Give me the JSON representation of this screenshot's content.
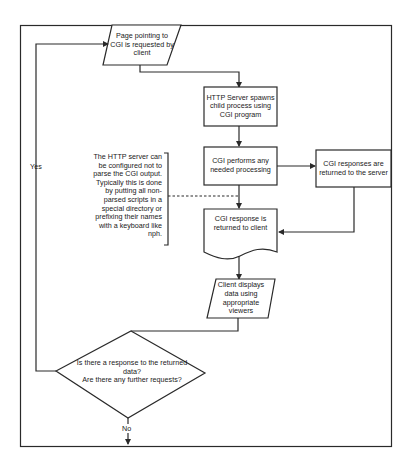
{
  "diagram": {
    "type": "flowchart",
    "nodes": {
      "request": {
        "shape": "parallelogram",
        "text": "Page pointing to CGI is requested by client"
      },
      "spawn": {
        "shape": "rectangle",
        "text": "HTTP Server spawns child process using CGI program"
      },
      "process": {
        "shape": "rectangle",
        "text": "CGI performs any needed processing"
      },
      "server_return": {
        "shape": "rectangle",
        "text": "CGI responses are returned to the server"
      },
      "client_return": {
        "shape": "document",
        "text": "CGI response is returned to client"
      },
      "display": {
        "shape": "parallelogram",
        "text": "Client displays data using appropriate viewers"
      },
      "decision": {
        "shape": "diamond",
        "line1": "Is there a response to the returned data?",
        "line2": "Are there any further requests?"
      }
    },
    "annotation": {
      "text": "The HTTP server can be configured not to parse the CGI output. Typically this is done by putting all non-parsed scripts in a special directory or prefixing their names with a keyboard like nph."
    },
    "edge_labels": {
      "yes": "Yes",
      "no": "No"
    },
    "colors": {
      "stroke": "#2a2a2a",
      "background": "#ffffff",
      "text": "#1a1a1a"
    }
  }
}
